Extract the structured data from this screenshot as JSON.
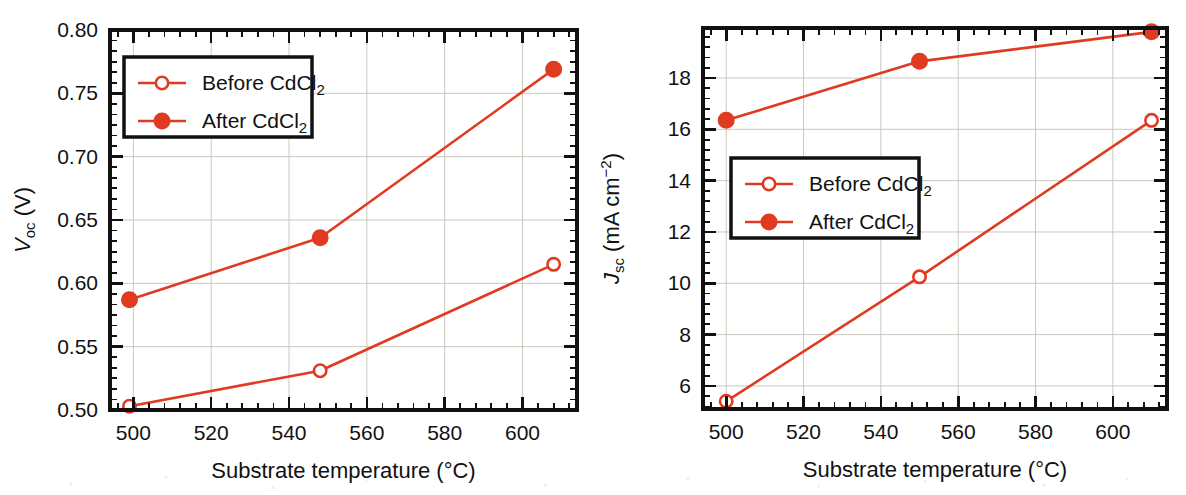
{
  "figure": {
    "accent_color": "#E03A20",
    "axis_color": "#111111",
    "grid_color": "#C9C7BD",
    "background": "#FFFFFF",
    "panel_count": 2
  },
  "chart_data": [
    {
      "id": "voc-panel",
      "type": "line",
      "title": "",
      "xlabel": "Substrate temperature (°C)",
      "ylabel": "V_oc (V)",
      "ylabel_parts": {
        "symbol": "V",
        "subscript": "oc",
        "units": "(V)"
      },
      "xlim": [
        494,
        614
      ],
      "ylim": [
        0.5,
        0.8
      ],
      "xticks": [
        500,
        520,
        540,
        560,
        580,
        600
      ],
      "xtick_labels": [
        "500",
        "520",
        "540",
        "560",
        "580",
        "600"
      ],
      "yticks": [
        0.5,
        0.55,
        0.6,
        0.65,
        0.7,
        0.75,
        0.8
      ],
      "ytick_labels": [
        "0.50",
        "0.55",
        "0.60",
        "0.65",
        "0.70",
        "0.75",
        "0.80"
      ],
      "x_minor_per_major": 4,
      "y_minor_per_major": 5,
      "grid": true,
      "legend_position": "upper-left",
      "series": [
        {
          "name": "Before CdCl2",
          "label_base": "Before CdCl",
          "label_sub": "2",
          "marker": "open-circle",
          "x": [
            499,
            548,
            608
          ],
          "values": [
            0.503,
            0.531,
            0.615
          ]
        },
        {
          "name": "After CdCl2",
          "label_base": "After CdCl",
          "label_sub": "2",
          "marker": "filled-circle",
          "x": [
            499,
            548,
            608
          ],
          "values": [
            0.587,
            0.636,
            0.769
          ]
        }
      ]
    },
    {
      "id": "jsc-panel",
      "type": "line",
      "title": "",
      "xlabel": "Substrate temperature (°C)",
      "ylabel": "J_sc (mA cm^-2)",
      "ylabel_parts": {
        "symbol": "J",
        "subscript": "sc",
        "units_base": "(mA cm",
        "units_sup": "−2",
        "units_close": ")"
      },
      "xlim": [
        494,
        614
      ],
      "ylim": [
        5.1,
        19.95
      ],
      "xticks": [
        500,
        520,
        540,
        560,
        580,
        600
      ],
      "xtick_labels": [
        "500",
        "520",
        "540",
        "560",
        "580",
        "600"
      ],
      "yticks": [
        6,
        8,
        10,
        12,
        14,
        16,
        18
      ],
      "ytick_labels": [
        "6",
        "8",
        "10",
        "12",
        "14",
        "16",
        "18"
      ],
      "x_minor_per_major": 4,
      "y_minor_per_major": 4,
      "grid": true,
      "legend_position": "middle-left",
      "series": [
        {
          "name": "Before CdCl2",
          "label_base": "Before CdCl",
          "label_sub": "2",
          "marker": "open-circle",
          "x": [
            500,
            550,
            610
          ],
          "values": [
            5.4,
            10.25,
            16.35
          ]
        },
        {
          "name": "After CdCl2",
          "label_base": "After CdCl",
          "label_sub": "2",
          "marker": "filled-circle",
          "x": [
            500,
            550,
            610
          ],
          "values": [
            16.35,
            18.65,
            19.8
          ]
        }
      ]
    }
  ]
}
